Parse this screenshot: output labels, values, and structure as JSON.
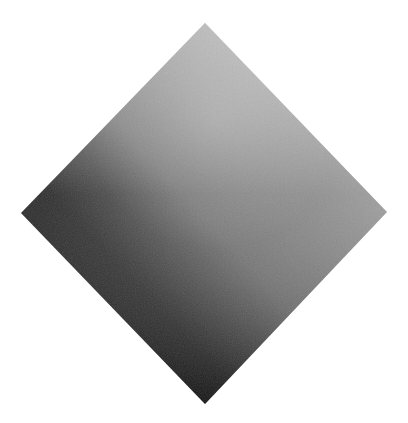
{
  "canvas": {
    "width": 408,
    "height": 423,
    "background": "#ffffff"
  },
  "shape": {
    "type": "diamond",
    "vertices": {
      "top": [
        205,
        23
      ],
      "right": [
        387,
        212
      ],
      "bottom": [
        205,
        404
      ],
      "left": [
        21,
        213
      ]
    },
    "fill": "gradient",
    "colors": {
      "top": "#b4b4b4",
      "center": "#7a7a7a",
      "right": "#7e7e7e",
      "bottom": "#2e2e2e",
      "left": "#0e0e0e",
      "highlight_band": "#9a9a9a"
    }
  }
}
